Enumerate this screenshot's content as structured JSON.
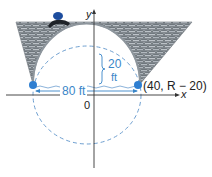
{
  "diagram": {
    "type": "stone arch bridge on coordinate axes",
    "axes": {
      "x_label": "x",
      "y_label": "y",
      "origin_label": "0"
    },
    "labels": {
      "span": "80 ft",
      "height_value": "20",
      "height_unit": "ft",
      "point": "(40, R − 20)"
    },
    "colors": {
      "accent_blue": "#2f7fd1",
      "dashed_circle": "#6e9fd0",
      "stone_fill": "#9aa3ab",
      "stone_dark": "#4d5358",
      "axis": "#333333",
      "person_blue": "#1d4d9e"
    }
  }
}
